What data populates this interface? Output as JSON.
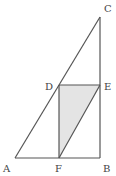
{
  "diagram": {
    "labels": {
      "A": "A",
      "B": "B",
      "C": "C",
      "D": "D",
      "E": "E",
      "F": "F"
    },
    "points": {
      "A": [
        15,
        158
      ],
      "B": [
        100,
        158
      ],
      "C": [
        100,
        17
      ],
      "D": [
        59,
        85
      ],
      "E": [
        100,
        85
      ],
      "F": [
        59,
        158
      ]
    },
    "segments": [
      "AC",
      "CB",
      "AB",
      "DE",
      "DF",
      "FE"
    ],
    "shaded_region": [
      "D",
      "F",
      "E"
    ],
    "colors": {
      "line": "#555555",
      "shade": "#e4e4e4"
    }
  }
}
